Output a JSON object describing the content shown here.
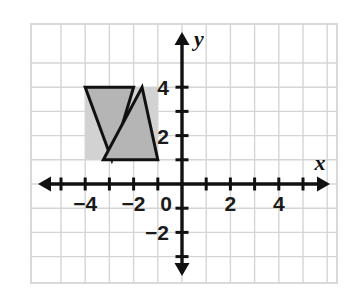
{
  "figure": {
    "title": "",
    "background_color": "#ffffff",
    "frame": {
      "border_color": "#d9d9d9",
      "x_min_px": 31,
      "y_min_px": 24,
      "x_max_px": 337,
      "y_max_px": 283
    }
  },
  "chart_data": {
    "type": "scatter",
    "title": "",
    "xlabel": "x",
    "ylabel": "y",
    "xlim": [
      -5,
      5.4
    ],
    "ylim": [
      -3.2,
      4.9
    ],
    "grid": true,
    "grid_spacing": 1,
    "grid_color": "#d5d5d5",
    "axis_color": "#111111",
    "legend": "none",
    "x_ticks": [
      -4,
      -2,
      0,
      2,
      4
    ],
    "x_tick_labels": [
      "−4",
      "−2",
      "0",
      "2",
      "4"
    ],
    "y_ticks": [
      -2,
      2,
      4
    ],
    "y_tick_labels": [
      "−2",
      "2",
      "4"
    ],
    "x_minor_ticks": [
      -5,
      -3,
      -1,
      1,
      3,
      5
    ],
    "y_minor_ticks": [
      -3,
      -1,
      1,
      3
    ],
    "shapes": [
      {
        "name": "background-rectangle",
        "kind": "rectangle",
        "fill": "#d2d2d2",
        "stroke": "none",
        "vertices": [
          [
            -4,
            4
          ],
          [
            -1,
            4
          ],
          [
            -1,
            1
          ],
          [
            -4,
            1
          ]
        ]
      },
      {
        "name": "triangle-left-inverted",
        "kind": "triangle",
        "fill": "#b5b5b5",
        "stroke": "#111111",
        "stroke_width": 3,
        "vertices": [
          [
            -4,
            4
          ],
          [
            -2,
            4
          ],
          [
            -2.9,
            1
          ]
        ]
      },
      {
        "name": "triangle-right-upright",
        "kind": "triangle",
        "fill": "#b5b5b5",
        "stroke": "#111111",
        "stroke_width": 3,
        "vertices": [
          [
            -1.65,
            4
          ],
          [
            -1,
            1
          ],
          [
            -3.25,
            1
          ]
        ]
      }
    ]
  }
}
